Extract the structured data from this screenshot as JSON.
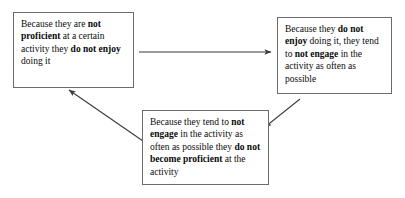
{
  "diagram": {
    "background_color": "#ffffff",
    "box_border_color": "#6b6b6b",
    "arrow_color": "#3a3a3a",
    "nodes": [
      {
        "id": "node-1",
        "name": "box-not-proficient-not-enjoy",
        "segments": [
          {
            "text": "Because they are ",
            "bold": false
          },
          {
            "text": "not proficient",
            "bold": true
          },
          {
            "text": " at a certain activity they ",
            "bold": false
          },
          {
            "text": "do not enjoy",
            "bold": true
          },
          {
            "text": " doing it",
            "bold": false
          }
        ],
        "plain_text": "Because they are not proficient at a certain activity they do not enjoy doing it"
      },
      {
        "id": "node-2",
        "name": "box-not-enjoy-not-engage",
        "segments": [
          {
            "text": "Because they ",
            "bold": false
          },
          {
            "text": "do not enjoy",
            "bold": true
          },
          {
            "text": " doing it, they tend to ",
            "bold": false
          },
          {
            "text": "not engage",
            "bold": true
          },
          {
            "text": " in the activity as often as possible",
            "bold": false
          }
        ],
        "plain_text": "Because they do not enjoy doing it, they tend to not engage in the activity as often as possible"
      },
      {
        "id": "node-3",
        "name": "box-not-engage-not-proficient",
        "segments": [
          {
            "text": "Because they tend to ",
            "bold": false
          },
          {
            "text": "not engage",
            "bold": true
          },
          {
            "text": " in the activity as often as possible they ",
            "bold": false
          },
          {
            "text": "do not become proficient",
            "bold": true
          },
          {
            "text": " at the activity",
            "bold": false
          }
        ],
        "plain_text": "Because they tend to not engage in the activity as often as possible they do not become proficient at the activity"
      }
    ],
    "arrows": [
      {
        "name": "arrow-box1-to-box2",
        "from": "node-1",
        "to": "node-2",
        "direction": "right"
      },
      {
        "name": "arrow-box2-to-box3",
        "from": "node-2",
        "to": "node-3",
        "direction": "down-left"
      },
      {
        "name": "arrow-box3-to-box1",
        "from": "node-3",
        "to": "node-1",
        "direction": "up-left"
      }
    ]
  }
}
